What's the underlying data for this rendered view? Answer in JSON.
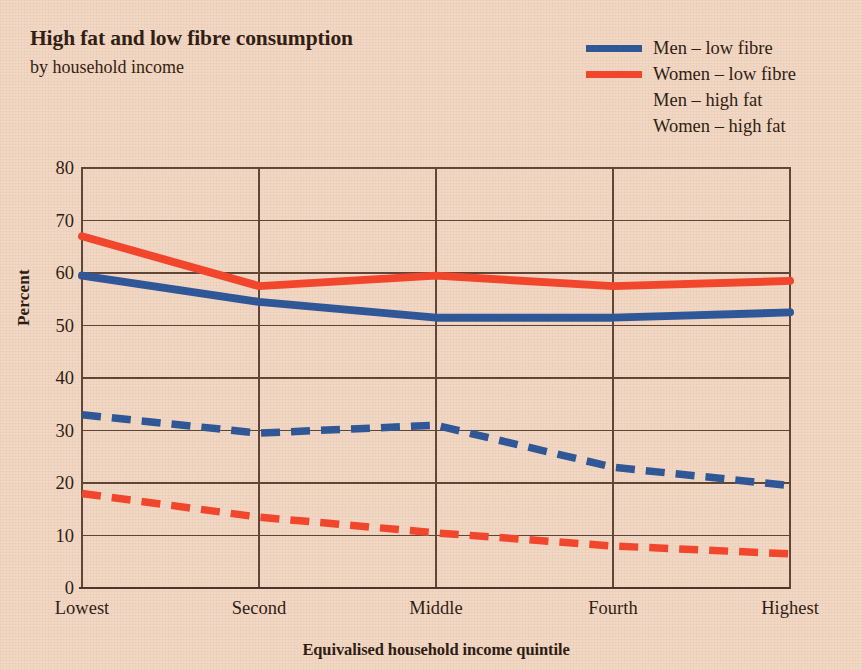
{
  "header": {
    "title": "High fat and low fibre consumption",
    "subtitle": "by household income"
  },
  "legend": {
    "position": "top-right",
    "items": [
      {
        "label": "Men – low fibre",
        "color": "#2b5699",
        "style": "solid",
        "swatch_name": "legend-swatch-men-low-fibre"
      },
      {
        "label": "Women – low fibre",
        "color": "#f4452b",
        "style": "solid",
        "swatch_name": "legend-swatch-women-low-fibre"
      },
      {
        "label": "Men – high fat",
        "color": "#2b5699",
        "style": "dashed",
        "swatch_name": "legend-swatch-men-high-fat"
      },
      {
        "label": "Women – high fat",
        "color": "#f4452b",
        "style": "dashed",
        "swatch_name": "legend-swatch-women-high-fat"
      }
    ]
  },
  "colors": {
    "background": "#f2d8c4",
    "blue": "#2b5699",
    "red": "#f4452b",
    "axis": "#5d4436",
    "text": "#2b1a12"
  },
  "axes": {
    "y_ticks": [
      80,
      70,
      60,
      50,
      40,
      30,
      20,
      10,
      0
    ],
    "y_title": "Percent",
    "x_title": "Equivalised household income quintile",
    "x_ticks": [
      "Lowest",
      "Second",
      "Middle",
      "Fourth",
      "Highest"
    ]
  },
  "chart_data": {
    "type": "line",
    "title": "High fat and low fibre consumption",
    "subtitle": "by household income",
    "xlabel": "Equivalised household income quintile",
    "ylabel": "Percent",
    "ylim": [
      0,
      80
    ],
    "ytick_step": 10,
    "grid": true,
    "legend_position": "top-right",
    "categories": [
      "Lowest",
      "Second",
      "Middle",
      "Fourth",
      "Highest"
    ],
    "series": [
      {
        "name": "Men – low fibre",
        "style": "solid",
        "color": "#2b5699",
        "values": [
          59.5,
          54.5,
          51.5,
          51.5,
          52.5
        ]
      },
      {
        "name": "Women – low fibre",
        "style": "solid",
        "color": "#f4452b",
        "values": [
          67.0,
          57.5,
          59.5,
          57.5,
          58.5
        ]
      },
      {
        "name": "Men – high fat",
        "style": "dashed",
        "color": "#2b5699",
        "values": [
          33.0,
          29.5,
          31.0,
          23.0,
          19.5
        ]
      },
      {
        "name": "Women – high fat",
        "style": "dashed",
        "color": "#f4452b",
        "values": [
          18.0,
          13.5,
          10.5,
          8.0,
          6.5
        ]
      }
    ]
  }
}
